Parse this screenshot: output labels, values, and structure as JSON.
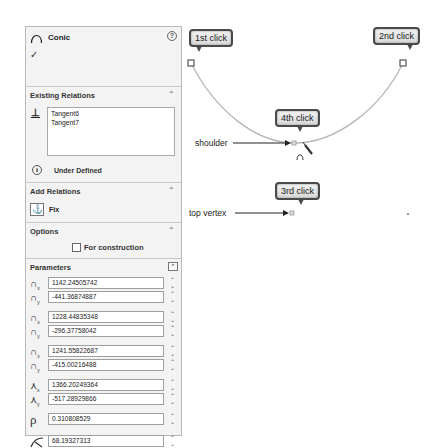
{
  "panel": {
    "title": "Conic",
    "help_icon": "?",
    "ok_icon": "✓",
    "existing_relations": {
      "header": "Existing Relations",
      "items": [
        "Tangent6",
        "Tangent7"
      ],
      "status": "Under Defined"
    },
    "add_relations": {
      "header": "Add Relations",
      "fix_label": "Fix"
    },
    "options": {
      "header": "Options",
      "for_construction_label": "For construction",
      "for_construction_checked": false
    },
    "parameters": {
      "header": "Parameters",
      "start_x": "1142.24505742",
      "start_y": "-441.36874887",
      "end_x": "1228.44835348",
      "end_y": "-296.37758042",
      "top_x": "1241.55822687",
      "top_y": "-415.00216488",
      "shoulder_x": "1366.20249364",
      "shoulder_y": "-517.28929866",
      "rho": "0.310808529",
      "curvature": "68.19327313"
    }
  },
  "canvas": {
    "callouts": {
      "first": "1st click",
      "second": "2nd click",
      "third": "3rd click",
      "fourth": "4th click"
    },
    "annotations": {
      "shoulder": "shoulder",
      "top_vertex": "top vertex"
    },
    "curve_color": "#b6b6b6",
    "endpoint_color": "#555555"
  }
}
